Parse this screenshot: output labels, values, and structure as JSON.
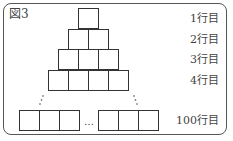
{
  "figure": {
    "title": "図3",
    "rows": [
      {
        "label": "1行目",
        "cells": 1
      },
      {
        "label": "2行目",
        "cells": 2
      },
      {
        "label": "3行目",
        "cells": 3
      },
      {
        "label": "4行目",
        "cells": 4
      },
      {
        "label": "100行目",
        "cells": 100
      }
    ],
    "ellipsis": "…",
    "vertical_dots_left": "⋰",
    "vertical_dots_right": "⋱"
  }
}
